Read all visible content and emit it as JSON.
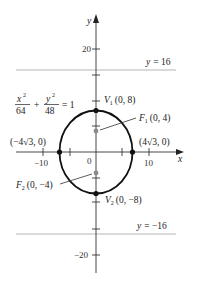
{
  "diagram": {
    "equation": {
      "x_num": "x",
      "x_den": "64",
      "y_num": "y",
      "y_den": "48",
      "plus": "+",
      "rhs": "= 1"
    },
    "axes": {
      "x_label": "x",
      "y_label": "y"
    },
    "x_ticks": {
      "neg10": "−10",
      "zero": "0",
      "pos10": "10"
    },
    "y_ticks": {
      "pos20": "20",
      "neg20": "−20"
    },
    "directrix_top": "y = 16",
    "directrix_bottom": "y = −16",
    "points": {
      "v1_name": "V",
      "v1_sub": "1",
      "v1_coord": "(0, 8)",
      "v2_name": "V",
      "v2_sub": "2",
      "v2_coord": "(0, −8)",
      "f1_name": "F",
      "f1_sub": "1",
      "f1_coord": "(0, 4)",
      "f2_name": "F",
      "f2_sub": "2",
      "f2_coord": "(0, −4)",
      "left_vertex": "(−4√3, 0)",
      "right_vertex": "(4√3, 0)"
    },
    "colors": {
      "curve": "#111111",
      "axis": "#333333",
      "directrix": "#b5b5b5",
      "focus": "#8a8a8a"
    }
  }
}
